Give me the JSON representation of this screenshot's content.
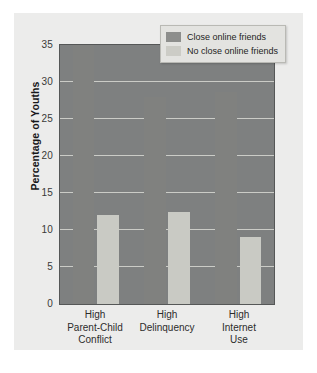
{
  "chart_data": {
    "type": "bar",
    "title": "",
    "xlabel": "",
    "ylabel": "Percentage of Youths",
    "ylim": [
      0,
      35
    ],
    "yticks": [
      0,
      5,
      10,
      15,
      20,
      25,
      30,
      35
    ],
    "grid": true,
    "legend_position": "top-right",
    "categories": [
      "High\nParent-Child\nConflict",
      "High\nDelinquency",
      "High\nInternet\nUse"
    ],
    "category_lines": [
      [
        "High",
        "Parent-Child",
        "Conflict"
      ],
      [
        "High",
        "Delinquency"
      ],
      [
        "High",
        "Internet",
        "Use"
      ]
    ],
    "series": [
      {
        "name": "Close online friends",
        "color": "#80817f",
        "values": [
          35,
          28,
          28.7
        ]
      },
      {
        "name": "No close online friends",
        "color": "#c9cac4",
        "values": [
          12,
          12.5,
          9
        ]
      }
    ]
  },
  "legend": {
    "items": [
      {
        "label": "Close online friends"
      },
      {
        "label": "No close online friends"
      }
    ]
  },
  "colors": {
    "figure_background": "#ececeb",
    "plot_background": "#7e8080",
    "gridline": "#d8d9d4",
    "dark_bar": "#80817f",
    "light_bar": "#c9cac4",
    "axis_text": "#3a3a38"
  }
}
